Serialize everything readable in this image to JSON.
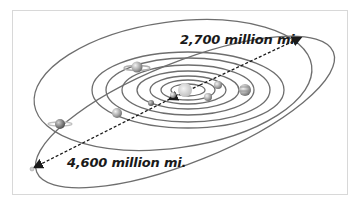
{
  "diagram": {
    "labels": {
      "inner_distance": "2,700 million mi.",
      "outer_distance": "4,600 million mi."
    },
    "colors": {
      "orbit": "#6e6e6e",
      "arrow": "#1a1a1a",
      "frame": "#d8d8d8",
      "planet": "#9a9a9a",
      "sun": "#c8c8c8"
    },
    "bodies": [
      {
        "name": "sun"
      },
      {
        "name": "mercury"
      },
      {
        "name": "venus"
      },
      {
        "name": "earth"
      },
      {
        "name": "mars"
      },
      {
        "name": "jupiter"
      },
      {
        "name": "saturn"
      },
      {
        "name": "uranus"
      },
      {
        "name": "neptune"
      },
      {
        "name": "pluto"
      }
    ]
  }
}
